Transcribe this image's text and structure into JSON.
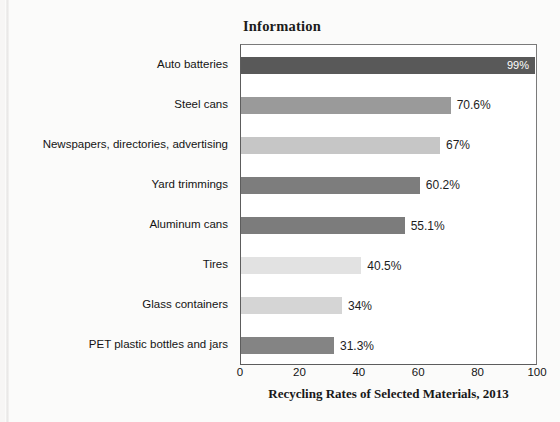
{
  "figure": {
    "title": "Information",
    "caption": "Recycling Rates of Selected Materials, 2013"
  },
  "chart_data": {
    "type": "bar",
    "orientation": "horizontal",
    "title": "Information",
    "xlabel": "Recycling Rates of Selected Materials, 2013",
    "ylabel": "",
    "xlim": [
      0,
      100
    ],
    "xticks": [
      0,
      20,
      40,
      60,
      80,
      100
    ],
    "xtick_labels": [
      "0",
      "20",
      "40",
      "60",
      "80",
      "100"
    ],
    "grid": false,
    "legend": false,
    "categories": [
      "Auto batteries",
      "Steel cans",
      "Newspapers, directories, advertising",
      "Yard trimmings",
      "Aluminum cans",
      "Tires",
      "Glass containers",
      "PET plastic bottles and jars"
    ],
    "values": [
      99,
      70.6,
      67,
      60.2,
      55.1,
      40.5,
      34,
      31.3
    ],
    "value_labels": [
      "99%",
      "70.6%",
      "67%",
      "60.2%",
      "55.1%",
      "40.5%",
      "34%",
      "31.3%"
    ],
    "value_label_position": [
      "inside",
      "outside",
      "outside",
      "outside",
      "outside",
      "outside",
      "outside",
      "outside"
    ],
    "bar_colors": [
      "#595959",
      "#9a9a9a",
      "#c6c6c6",
      "#7d7d7d",
      "#7c7c7c",
      "#e2e2e2",
      "#d5d5d5",
      "#848484"
    ]
  }
}
